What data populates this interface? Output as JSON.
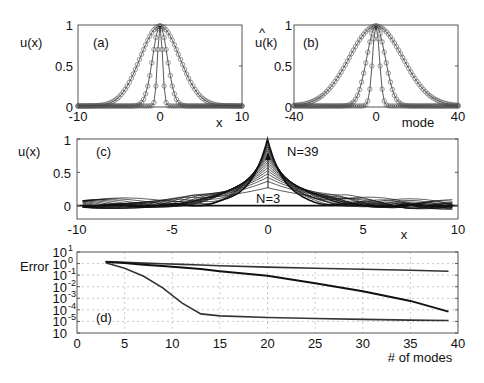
{
  "chart_data": [
    {
      "panel": "(a)",
      "type": "line",
      "xlabel": "x",
      "ylabel": "u(x)",
      "xlim": [
        -10,
        10
      ],
      "ylim": [
        0,
        1
      ],
      "xticks": [
        "-10",
        "0",
        "10"
      ],
      "yticks": [
        "0",
        "0.5",
        "1"
      ],
      "markers": "open circles",
      "series": [
        {
          "name": "wide Gaussian",
          "shape": "exp(-x^2/(2*2.4^2))",
          "sigma": 2.4
        },
        {
          "name": "medium Gaussian",
          "shape": "exp(-x^2/(2*0.9^2))",
          "sigma": 0.9
        },
        {
          "name": "narrow Gaussian",
          "shape": "exp(-x^2/(2*0.3^2))",
          "sigma": 0.3
        }
      ]
    },
    {
      "panel": "(b)",
      "type": "line",
      "xlabel": "mode",
      "ylabel": "û(k)",
      "xlim": [
        -40,
        40
      ],
      "ylim": [
        0,
        1
      ],
      "xticks": [
        "-40",
        "0",
        "40"
      ],
      "yticks": [
        "0",
        "0.5",
        "1"
      ],
      "markers": "open circles",
      "series": [
        {
          "name": "wide spectrum",
          "sigma": 13
        },
        {
          "name": "medium spectrum",
          "sigma": 4.5
        },
        {
          "name": "narrow spectrum",
          "sigma": 1.7
        }
      ]
    },
    {
      "panel": "(c)",
      "type": "line",
      "xlabel": "x",
      "ylabel": "u(x)",
      "xlim": [
        -10,
        10
      ],
      "ylim": [
        -0.2,
        1
      ],
      "xticks": [
        "-10",
        "-5",
        "0",
        "5",
        "10"
      ],
      "yticks": [
        "0",
        "0.5",
        "1"
      ],
      "annotations": [
        "N=39",
        "N=3"
      ],
      "series_count": 19,
      "description": "Truncated mode reconstructions converging from a broad bump (N=3, peak ~0.27) to a sharp peak (N=39, peak ~1)"
    },
    {
      "panel": "(d)",
      "type": "line",
      "xlabel": "# of modes",
      "ylabel": "Error",
      "yscale": "log",
      "xlim": [
        0,
        40
      ],
      "ylim": [
        1e-06,
        10
      ],
      "xticks": [
        "0",
        "5",
        "10",
        "15",
        "20",
        "25",
        "30",
        "35",
        "40"
      ],
      "yticks": [
        "10^1",
        "10^0",
        "10^-1",
        "10^-2",
        "10^-3",
        "10^-4",
        "10^-5",
        "10^-6"
      ],
      "grid": true,
      "x": [
        3,
        5,
        7,
        9,
        11,
        13,
        15,
        20,
        25,
        30,
        35,
        39
      ],
      "series": [
        {
          "name": "slow (wide)",
          "values": [
            1.5,
            1.3,
            1.1,
            0.95,
            0.85,
            0.75,
            0.65,
            0.5,
            0.4,
            0.32,
            0.26,
            0.22
          ]
        },
        {
          "name": "medium",
          "values": [
            1.4,
            1.1,
            0.8,
            0.6,
            0.45,
            0.33,
            0.22,
            0.09,
            0.02,
            0.004,
            0.0006,
            7e-05
          ]
        },
        {
          "name": "fast (narrow)",
          "values": [
            1.2,
            0.4,
            0.08,
            0.008,
            0.0004,
            4.5e-05,
            3e-05,
            2.2e-05,
            1.8e-05,
            1.5e-05,
            1.3e-05,
            1.2e-05
          ]
        }
      ]
    }
  ],
  "labels": {
    "a": {
      "panel": "(a)",
      "ylabel": "u(x)",
      "xlabel": "x",
      "xt": [
        "-10",
        "0",
        "10"
      ],
      "yt": [
        "0",
        "0.5",
        "1"
      ]
    },
    "b": {
      "panel": "(b)",
      "ylabel": "u(k)",
      "hat": "^",
      "xlabel": "mode",
      "xt": [
        "-40",
        "0",
        "40"
      ],
      "yt": [
        "0",
        "0.5",
        "1"
      ]
    },
    "c": {
      "panel": "(c)",
      "ylabel": "u(x)",
      "xlabel": "x",
      "xt": [
        "-10",
        "-5",
        "0",
        "5",
        "10"
      ],
      "yt": [
        "0",
        "0.5",
        "1"
      ],
      "ann_top": "N=39",
      "ann_bottom": "N=3"
    },
    "d": {
      "panel": "(d)",
      "ylabel": "Error",
      "xlabel": "# of modes",
      "xt": [
        "0",
        "5",
        "10",
        "15",
        "20",
        "25",
        "30",
        "35",
        "40"
      ],
      "yt_base": "10",
      "yt_exp": [
        "1",
        "0",
        "-1",
        "-2",
        "-3",
        "-4",
        "-5",
        ""
      ]
    }
  },
  "colors": {
    "line": "#111111",
    "frame": "#555555",
    "grid": "#bbbbbb",
    "marker": "#555555"
  }
}
